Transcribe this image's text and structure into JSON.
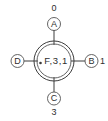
{
  "diagram": {
    "type": "four-terminal-node-schematic",
    "background_color": "#ffffff",
    "line_color": "#3c3c3c",
    "text_color": "#2e2e2e",
    "center": {
      "label": "F,3,1",
      "marker": "origin-dot",
      "shape": "double-circle"
    },
    "terminals": [
      {
        "id": "top",
        "letter": "A",
        "port": "0"
      },
      {
        "id": "right",
        "letter": "B",
        "port": "1"
      },
      {
        "id": "bottom",
        "letter": "C",
        "port": "3"
      },
      {
        "id": "left",
        "letter": "D",
        "port": ""
      }
    ]
  }
}
